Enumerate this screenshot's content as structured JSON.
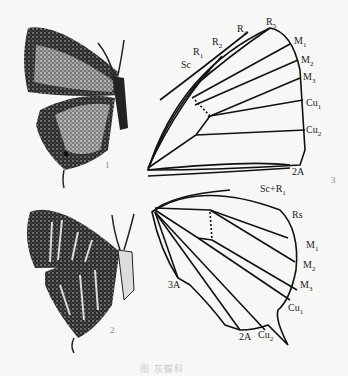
{
  "figure": {
    "panel_numbers": {
      "p1": "1",
      "p2": "2",
      "p3": "3"
    },
    "caption": "图 灰蝶科",
    "forewing_veins": {
      "sc": "Sc",
      "r1": "R1",
      "r2": "R2",
      "r4": "R4",
      "r5": "R5",
      "m1": "M1",
      "m2": "M2",
      "m3": "M3",
      "cu1": "Cu1",
      "cu2": "Cu2",
      "a2": "2A"
    },
    "hindwing_veins": {
      "scr1": "Sc+R1",
      "rs": "Rs",
      "m1": "M1",
      "m2": "M2",
      "m3": "M3",
      "cu1": "Cu1",
      "cu2": "Cu2",
      "a2": "2A",
      "a3": "3A"
    }
  }
}
